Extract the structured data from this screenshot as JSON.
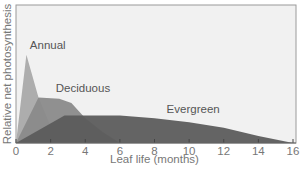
{
  "chart_data": {
    "type": "area",
    "title": "",
    "xlabel": "Leaf life (months)",
    "ylabel": "Relative net photosynthesis",
    "xlim": [
      0,
      16
    ],
    "ylim": [
      0,
      1
    ],
    "x_ticks": [
      0,
      2,
      4,
      6,
      8,
      10,
      12,
      14,
      16
    ],
    "grid": false,
    "legend": "inline labels",
    "series": [
      {
        "name": "Annual",
        "color": "#a9a9a9",
        "x": [
          0,
          0.6,
          1.3,
          2.0
        ],
        "y": [
          0,
          0.64,
          0.33,
          0.12
        ]
      },
      {
        "name": "Deciduous",
        "color": "#8a8a8a",
        "x": [
          0,
          1.3,
          2.5,
          3.2,
          4.0,
          5.0,
          6.0
        ],
        "y": [
          0,
          0.33,
          0.32,
          0.29,
          0.18,
          0.08,
          0
        ]
      },
      {
        "name": "Evergreen",
        "color": "#5c5c5c",
        "x": [
          0,
          2.8,
          6,
          8,
          10,
          12,
          14,
          16
        ],
        "y": [
          0,
          0.2,
          0.2,
          0.18,
          0.15,
          0.11,
          0.05,
          0
        ]
      }
    ],
    "annotations": [
      {
        "text": "Annual",
        "x": 0.8,
        "y": 0.68
      },
      {
        "text": "Deciduous",
        "x": 2.3,
        "y": 0.37
      },
      {
        "text": "Evergreen",
        "x": 8.7,
        "y": 0.22
      }
    ]
  },
  "labels": {
    "xlabel": "Leaf life (months)",
    "ylabel": "Relative net photosynthesis",
    "annual": "Annual",
    "deciduous": "Deciduous",
    "evergreen": "Evergreen"
  }
}
